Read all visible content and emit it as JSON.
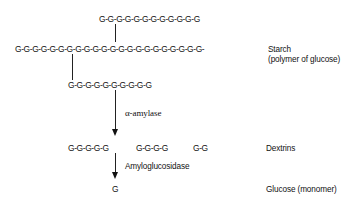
{
  "diagram": {
    "starch": {
      "top_branch": "G-G-G-G-G-G-G-G-G-G-G-G",
      "main_chain": "G-G-G-G-G-G-G-G-G-G-G-G-G-G-G-G-G-G-G-G-G-G-",
      "lower_branch": "G-G-G-G-G-G-G-G-G-G",
      "label_line1": "Starch",
      "label_line2": "(polymer of glucose)"
    },
    "step1": {
      "enzyme": "α-amylase"
    },
    "dextrins": {
      "fragments": [
        "G-G-G-G-G",
        "G-G-G-G",
        "G-G"
      ],
      "label": "Dextrins"
    },
    "step2": {
      "enzyme": "Amyloglucosidase"
    },
    "glucose": {
      "symbol": "G",
      "label": "Glucose (monomer)"
    }
  }
}
